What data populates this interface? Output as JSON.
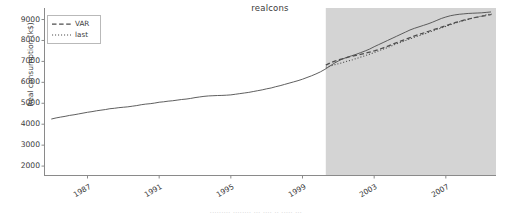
{
  "figure": {
    "title": "realcons",
    "bottom_fragment": "......... ........ ... .... .. ..... ..."
  },
  "axes": {
    "ylabel": "Real consumption (k$)",
    "yticks": [
      2000,
      3000,
      4000,
      5000,
      6000,
      7000,
      8000,
      9000
    ],
    "xticks": [
      1987,
      1991,
      1995,
      1999,
      2003,
      2007
    ],
    "ylim": [
      1550,
      9550
    ],
    "xlim": [
      1984.6,
      2009.8
    ],
    "grid": false
  },
  "legend": {
    "position": "upper left",
    "entries": [
      {
        "label": "VAR",
        "style": "dashed"
      },
      {
        "label": "last",
        "style": "dotted"
      }
    ]
  },
  "colors": {
    "line": "#4d4d4d",
    "shade": "#d4d4d4",
    "spine": "#808080",
    "text": "#3b3b3b",
    "background": "#ffffff"
  },
  "shaded_region": {
    "label": "forecast-period",
    "x_start": 2000.3,
    "x_end": 2009.8,
    "color": "#d4d4d4"
  },
  "chart_data": {
    "type": "line",
    "title": "realcons",
    "xlabel": "",
    "ylabel": "Real consumption (k$)",
    "xlim": [
      1984.6,
      2009.8
    ],
    "ylim": [
      1550,
      9550
    ],
    "grid": false,
    "legend_position": "upper left",
    "yticks": [
      2000,
      3000,
      4000,
      5000,
      6000,
      7000,
      8000,
      9000
    ],
    "xticks": [
      1987,
      1991,
      1995,
      1999,
      2003,
      2007
    ],
    "shaded_region": [
      2000.3,
      2009.8
    ],
    "series": [
      {
        "name": "actual",
        "style": "solid",
        "color": "#4d4d4d",
        "x": [
          1985.0,
          1985.25,
          1985.5,
          1985.75,
          1986.0,
          1986.25,
          1986.5,
          1986.75,
          1987.0,
          1987.25,
          1987.5,
          1987.75,
          1988.0,
          1988.25,
          1988.5,
          1988.75,
          1989.0,
          1989.25,
          1989.5,
          1989.75,
          1990.0,
          1990.25,
          1990.5,
          1990.75,
          1991.0,
          1991.25,
          1991.5,
          1991.75,
          1992.0,
          1992.25,
          1992.5,
          1992.75,
          1993.0,
          1993.25,
          1993.5,
          1993.75,
          1994.0,
          1994.25,
          1994.5,
          1994.75,
          1995.0,
          1995.25,
          1995.5,
          1995.75,
          1996.0,
          1996.25,
          1996.5,
          1996.75,
          1997.0,
          1997.25,
          1997.5,
          1997.75,
          1998.0,
          1998.25,
          1998.5,
          1998.75,
          1999.0,
          1999.25,
          1999.5,
          1999.75,
          2000.0,
          2000.25,
          2000.5,
          2000.75,
          2001.0,
          2001.25,
          2001.5,
          2001.75,
          2002.0,
          2002.25,
          2002.5,
          2002.75,
          2003.0,
          2003.25,
          2003.5,
          2003.75,
          2004.0,
          2004.25,
          2004.5,
          2004.75,
          2005.0,
          2005.25,
          2005.5,
          2005.75,
          2006.0,
          2006.25,
          2006.5,
          2006.75,
          2007.0,
          2007.25,
          2007.5,
          2007.75,
          2008.0,
          2008.25,
          2008.5,
          2008.75,
          2009.0,
          2009.25,
          2009.5
        ],
        "y": [
          4250,
          4300,
          4340,
          4375,
          4420,
          4450,
          4490,
          4530,
          4570,
          4600,
          4640,
          4670,
          4700,
          4740,
          4760,
          4790,
          4810,
          4830,
          4860,
          4890,
          4930,
          4960,
          4980,
          5010,
          5050,
          5070,
          5100,
          5120,
          5150,
          5180,
          5200,
          5230,
          5270,
          5300,
          5330,
          5350,
          5360,
          5370,
          5375,
          5385,
          5400,
          5430,
          5460,
          5490,
          5520,
          5560,
          5600,
          5640,
          5690,
          5730,
          5790,
          5840,
          5900,
          5960,
          6020,
          6080,
          6150,
          6230,
          6310,
          6400,
          6500,
          6620,
          6760,
          6900,
          7020,
          7120,
          7200,
          7270,
          7340,
          7420,
          7500,
          7590,
          7700,
          7800,
          7900,
          8000,
          8100,
          8200,
          8300,
          8400,
          8500,
          8580,
          8650,
          8720,
          8790,
          8870,
          8960,
          9050,
          9120,
          9180,
          9220,
          9250,
          9270,
          9290,
          9300,
          9310,
          9320,
          9340,
          9360
        ]
      },
      {
        "name": "VAR",
        "style": "dashed",
        "color": "#4d4d4d",
        "x": [
          2000.3,
          2000.55,
          2000.8,
          2001.05,
          2001.3,
          2001.55,
          2001.8,
          2002.05,
          2002.3,
          2002.55,
          2002.8,
          2003.05,
          2003.3,
          2003.55,
          2003.8,
          2004.05,
          2004.3,
          2004.55,
          2004.8,
          2005.05,
          2005.3,
          2005.55,
          2005.8,
          2006.05,
          2006.3,
          2006.55,
          2006.8,
          2007.05,
          2007.3,
          2007.55,
          2007.8,
          2008.05,
          2008.3,
          2008.55,
          2008.8,
          2009.05,
          2009.3,
          2009.55
        ],
        "y": [
          6820,
          6930,
          7010,
          7080,
          7140,
          7200,
          7250,
          7300,
          7350,
          7400,
          7450,
          7510,
          7580,
          7660,
          7740,
          7830,
          7910,
          7990,
          8070,
          8150,
          8230,
          8300,
          8370,
          8440,
          8510,
          8580,
          8650,
          8720,
          8790,
          8860,
          8920,
          8980,
          9030,
          9080,
          9120,
          9160,
          9200,
          9240
        ]
      },
      {
        "name": "last",
        "style": "dotted",
        "color": "#4d4d4d",
        "x": [
          2000.3,
          2000.55,
          2000.8,
          2001.05,
          2001.3,
          2001.55,
          2001.8,
          2002.05,
          2002.3,
          2002.55,
          2002.8,
          2003.05,
          2003.3,
          2003.55,
          2003.8,
          2004.05,
          2004.3,
          2004.55,
          2004.8,
          2005.05,
          2005.3,
          2005.55,
          2005.8,
          2006.05,
          2006.3,
          2006.55,
          2006.8,
          2007.05,
          2007.3,
          2007.55,
          2007.8,
          2008.05,
          2008.3,
          2008.55,
          2008.8,
          2009.05,
          2009.3,
          2009.55
        ],
        "y": [
          6720,
          6780,
          6840,
          6900,
          6960,
          7020,
          7080,
          7150,
          7220,
          7290,
          7360,
          7440,
          7520,
          7600,
          7680,
          7770,
          7850,
          7930,
          8010,
          8090,
          8170,
          8240,
          8310,
          8390,
          8460,
          8540,
          8610,
          8690,
          8760,
          8830,
          8900,
          8960,
          9020,
          9080,
          9130,
          9180,
          9230,
          9280
        ]
      }
    ]
  }
}
